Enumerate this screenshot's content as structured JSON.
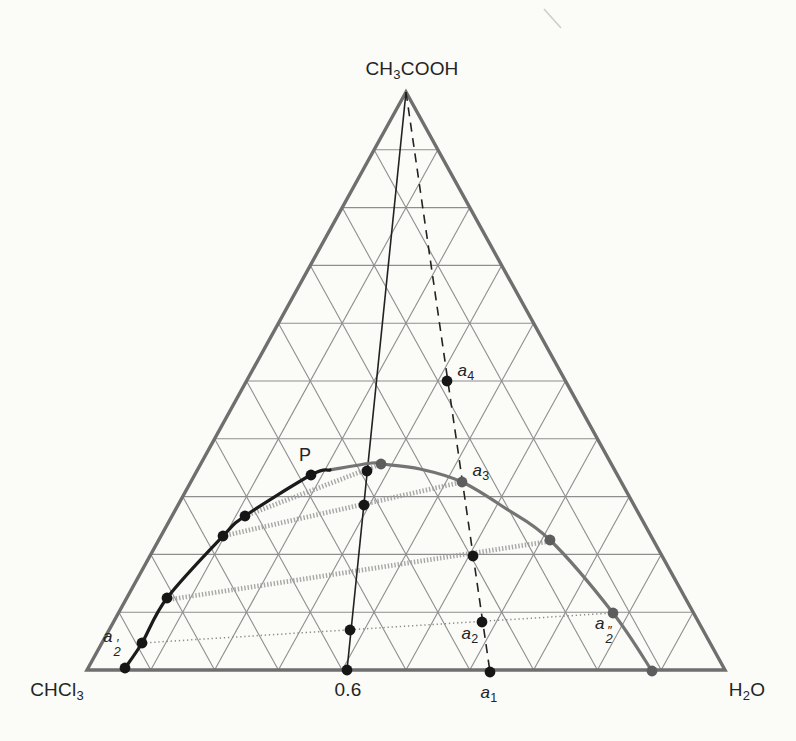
{
  "labels": {
    "apex": {
      "pre": "CH",
      "sub": "3",
      "post": "COOH"
    },
    "left": {
      "pre": "CHCl",
      "sub": "3",
      "post": ""
    },
    "right": {
      "pre": "H",
      "sub": "2",
      "post": "O"
    },
    "plait": "P",
    "tick": "0.6",
    "a1": {
      "base": "a",
      "sub": "1"
    },
    "a2": {
      "base": "a",
      "sub": "2"
    },
    "a3": {
      "base": "a",
      "sub": "3"
    },
    "a4": {
      "base": "a",
      "sub": "4"
    },
    "a2_prime": {
      "base": "a",
      "prime": "′",
      "sub": "2"
    },
    "a2_dprime": {
      "base": "a",
      "prime": "″",
      "sub": "2"
    }
  },
  "chart_data": {
    "type": "ternary_phase_diagram",
    "components": {
      "top": "CH3COOH",
      "bottom_left": "CHCl3",
      "bottom_right": "H2O"
    },
    "grid_divisions": 10,
    "triangle_px": {
      "apex": [
        406,
        92
      ],
      "left": [
        87,
        670
      ],
      "right": [
        725,
        670
      ]
    },
    "base_tick": {
      "label": "0.6",
      "px": [
        347,
        670
      ]
    },
    "binodal": {
      "left_branch_px": [
        [
          125,
          668
        ],
        [
          142,
          643
        ],
        [
          167,
          598
        ],
        [
          223,
          536
        ],
        [
          245,
          516
        ],
        [
          311,
          475
        ],
        [
          330,
          470
        ]
      ],
      "right_branch_px": [
        [
          330,
          470
        ],
        [
          372,
          463
        ],
        [
          381,
          464
        ],
        [
          420,
          469
        ],
        [
          462,
          482
        ],
        [
          505,
          508
        ],
        [
          550,
          540
        ],
        [
          613,
          613
        ],
        [
          652,
          671
        ]
      ],
      "left_branch_color": "#1b1b1b",
      "right_branch_color": "#747474"
    },
    "composition_lines": [
      {
        "name": "x06-line",
        "style": "solid",
        "from_px": [
          406,
          92
        ],
        "to_px": [
          347,
          670
        ]
      },
      {
        "name": "acid-addition-line",
        "style": "dashed",
        "from_px": [
          406,
          92
        ],
        "to_px": [
          490,
          672
        ]
      }
    ],
    "tie_lines": [
      {
        "style": "hatched",
        "from_px": [
          245,
          516
        ],
        "to_px": [
          381,
          464
        ]
      },
      {
        "style": "hatched",
        "from_px": [
          223,
          536
        ],
        "to_px": [
          462,
          482
        ]
      },
      {
        "style": "hatched",
        "from_px": [
          166,
          600
        ],
        "to_px": [
          551,
          541
        ]
      },
      {
        "style": "dotted",
        "from_px": [
          142,
          643
        ],
        "to_px": [
          613,
          613
        ]
      }
    ],
    "labeled_points": [
      {
        "id": "P",
        "px": [
          311,
          475
        ],
        "color": "black"
      },
      {
        "id": "a1",
        "px": [
          490,
          672
        ],
        "color": "black",
        "composition": {
          "CH3COOH": 0.0,
          "H2O": 0.63,
          "CHCl3": 0.37
        }
      },
      {
        "id": "a2",
        "px": [
          482,
          622
        ],
        "color": "black",
        "composition": {
          "CH3COOH": 0.08,
          "H2O": 0.58,
          "CHCl3": 0.34
        }
      },
      {
        "id": "a3",
        "px": [
          462,
          482
        ],
        "color": "gray",
        "composition": {
          "CH3COOH": 0.33,
          "H2O": 0.42,
          "CHCl3": 0.25
        }
      },
      {
        "id": "a4",
        "px": [
          447,
          381
        ],
        "color": "black",
        "composition": {
          "CH3COOH": 0.5,
          "H2O": 0.31,
          "CHCl3": 0.19
        }
      },
      {
        "id": "a2_prime",
        "px": [
          142,
          643
        ],
        "color": "black",
        "composition": {
          "CH3COOH": 0.05,
          "H2O": 0.06,
          "CHCl3": 0.89
        }
      },
      {
        "id": "a2_dprime",
        "px": [
          613,
          613
        ],
        "color": "gray",
        "composition": {
          "CH3COOH": 0.1,
          "H2O": 0.77,
          "CHCl3": 0.13
        }
      }
    ],
    "unlabeled_dots": {
      "black_px": [
        [
          125,
          668
        ],
        [
          167,
          598
        ],
        [
          223,
          536
        ],
        [
          245,
          516
        ],
        [
          367,
          471
        ],
        [
          364,
          505
        ],
        [
          350,
          630
        ],
        [
          347,
          670
        ],
        [
          473,
          556
        ]
      ],
      "gray_px": [
        [
          381,
          464
        ],
        [
          550,
          540
        ],
        [
          652,
          671
        ]
      ]
    },
    "style": {
      "edge_color": "#6f6f6f",
      "edge_width": 3.4,
      "grid_color": "#8e8e8e",
      "grid_width": 1.1,
      "curve_width": 3.2,
      "solid_line_color": "#222222",
      "solid_line_width": 1.6,
      "dashed_line_dash": "9 6.5",
      "tie_hatched_color": "#9c9c9c",
      "tie_hatched_width": 4.8,
      "tie_dotted_color": "#8a8a8a",
      "dot_black": "#161616",
      "dot_gray": "#5d5d5d",
      "dot_radius": 5.4,
      "background": "#fbfbf8"
    },
    "scan_artifact": {
      "from_px": [
        544,
        9
      ],
      "to_px": [
        561,
        28
      ]
    }
  }
}
